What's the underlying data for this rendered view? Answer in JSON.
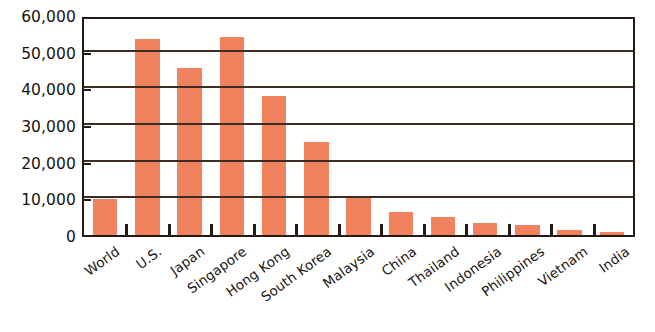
{
  "chart_data": {
    "type": "bar",
    "title": "",
    "subtitle": "",
    "xlabel": "",
    "ylabel": "",
    "categories": [
      "World",
      "U.S.",
      "Japan",
      "Singapore",
      "Hong Kong",
      "South Korea",
      "Malaysia",
      "China",
      "Thailand",
      "Indonesia",
      "Philippines",
      "Vietnam",
      "India"
    ],
    "values": [
      9800,
      53500,
      45500,
      54000,
      38000,
      25500,
      10000,
      6200,
      4800,
      3300,
      2800,
      1300,
      900
    ],
    "series": [
      {
        "name": "",
        "values": [
          9800,
          53500,
          45500,
          54000,
          38000,
          25500,
          10000,
          6200,
          4800,
          3300,
          2800,
          1300,
          900
        ]
      }
    ],
    "ylim": [
      0,
      60000
    ],
    "ytick_values": [
      0,
      10000,
      20000,
      30000,
      40000,
      50000,
      60000
    ],
    "ytick_labels": [
      "0",
      "10,000",
      "20,000",
      "30,000",
      "40,000",
      "50,000",
      "60,000"
    ],
    "grid": true,
    "grid_axis": "y",
    "legend": false,
    "legend_position": "none",
    "bar_color": "#f0825e",
    "axis_color": "#231a16",
    "grid_color": "#3b2d26",
    "background_color": "#ffffff",
    "label_rotation_degrees": -36
  }
}
